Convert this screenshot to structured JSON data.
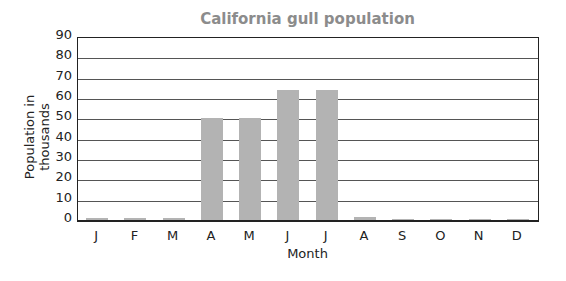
{
  "chart_data": {
    "type": "bar",
    "title": "California gull population",
    "xlabel": "Month",
    "ylabel": "Population in thousands",
    "categories": [
      "J",
      "F",
      "M",
      "A",
      "M",
      "J",
      "J",
      "A",
      "S",
      "O",
      "N",
      "D"
    ],
    "values": [
      1,
      1,
      1,
      50,
      50,
      64,
      64,
      1.5,
      0.5,
      0.5,
      0.5,
      0.5
    ],
    "ylim": [
      0,
      90
    ],
    "yticks": [
      0,
      10,
      20,
      30,
      40,
      50,
      60,
      70,
      80,
      90
    ],
    "grid": true,
    "legend": null,
    "bar_color": "#b3b3b3"
  }
}
